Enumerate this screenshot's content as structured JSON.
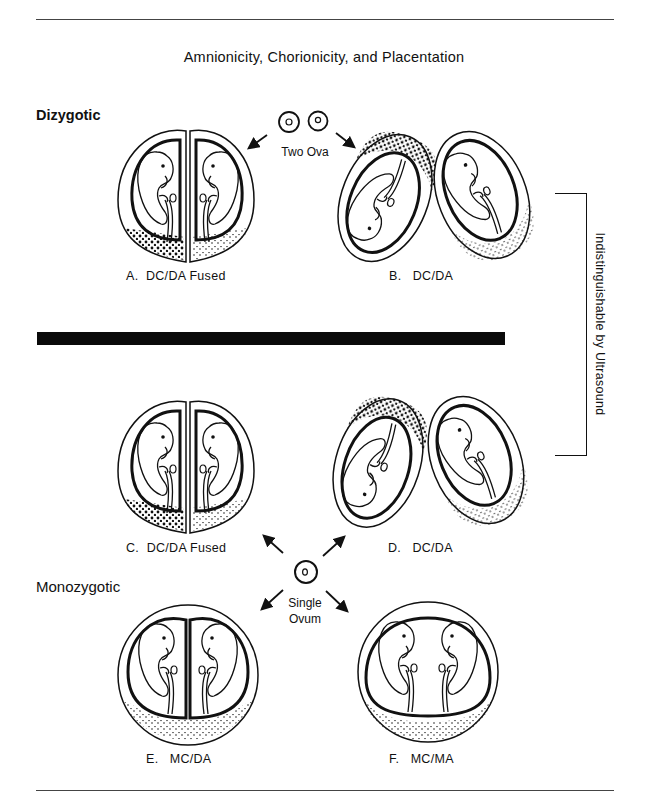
{
  "title": "Amnionicity, Chorionicity, and Placentation",
  "groups": {
    "dizygotic": "Dizygotic",
    "monozygotic": "Monozygotic"
  },
  "origins": {
    "two_ova": "Two Ova",
    "single_ovum_line1": "Single",
    "single_ovum_line2": "Ovum"
  },
  "panels": [
    {
      "id": "A",
      "label": "A.  DC/DA Fused"
    },
    {
      "id": "B",
      "label": "B.   DC/DA"
    },
    {
      "id": "C",
      "label": "C.  DC/DA Fused"
    },
    {
      "id": "D",
      "label": "D.   DC/DA"
    },
    {
      "id": "E",
      "label": "E.   MC/DA"
    },
    {
      "id": "F",
      "label": "F.   MC/MA"
    }
  ],
  "bracket_note": "Indistinguishable by Ultrasound",
  "colors": {
    "ink": "#111111",
    "background": "#ffffff"
  }
}
